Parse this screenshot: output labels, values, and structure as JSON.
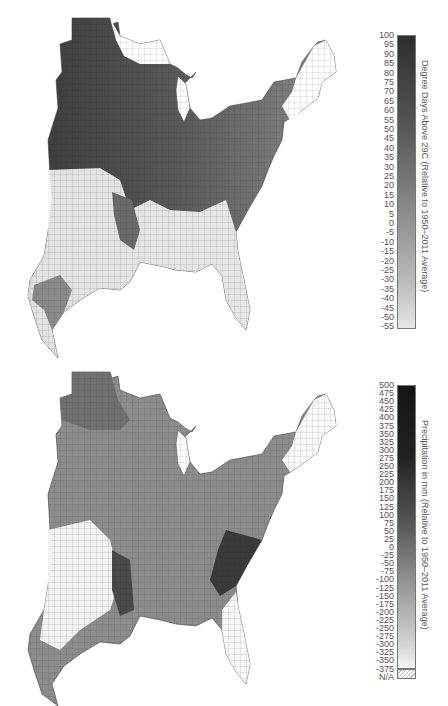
{
  "figure": {
    "panels": [
      {
        "id": "top",
        "title": "",
        "region": "Eastern United States (county level)",
        "colorbar": {
          "label": "Degree Days Above 29C (Relative to 1950–2011 Average)",
          "ticks": [
            "100",
            "95",
            "90",
            "85",
            "80",
            "75",
            "70",
            "65",
            "60",
            "55",
            "50",
            "45",
            "40",
            "35",
            "30",
            "25",
            "20",
            "15",
            "10",
            "5",
            "0",
            "-5",
            "-10",
            "-15",
            "-20",
            "-25",
            "-30",
            "-35",
            "-40",
            "-45",
            "-50",
            "-55"
          ],
          "min": -55,
          "max": 100,
          "colors": {
            "high": "#2e2e2e",
            "mid": "#8a8a8a",
            "low": "#e6e6e6"
          }
        }
      },
      {
        "id": "bottom",
        "title": "",
        "region": "Eastern United States (county level)",
        "colorbar": {
          "label": "Precipitation in mm (Relative to 1950–2011 Average)",
          "ticks": [
            "500",
            "475",
            "450",
            "425",
            "400",
            "375",
            "350",
            "325",
            "300",
            "275",
            "250",
            "225",
            "200",
            "175",
            "150",
            "125",
            "100",
            "75",
            "50",
            "25",
            "0",
            "-25",
            "-50",
            "-75",
            "-100",
            "-125",
            "-150",
            "-175",
            "-200",
            "-225",
            "-250",
            "-275",
            "-300",
            "-325",
            "-350",
            "-375"
          ],
          "na_label": "N/A",
          "min": -375,
          "max": 500,
          "colors": {
            "high": "#151515",
            "mid": "#7a7a7a",
            "low": "#f0f0f0",
            "na": "hatched"
          }
        }
      }
    ]
  }
}
